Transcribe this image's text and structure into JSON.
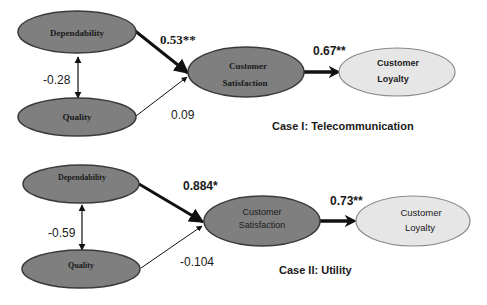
{
  "colors": {
    "node_dark": "#7f7f7f",
    "node_dark_stroke": "#3a3a3a",
    "node_light": "#e6e6e6",
    "node_light_stroke": "#8a8a8a",
    "arrow": "#111111",
    "text": "#1a1a1a"
  },
  "case1": {
    "title": "Case I: Telecommunication",
    "nodes": {
      "dependability": "Dependability",
      "quality": "Quality",
      "satisfaction_l1": "Customer",
      "satisfaction_l2": "Satisfaction",
      "loyalty_l1": "Customer",
      "loyalty_l2": "Loyalty"
    },
    "paths": {
      "dep_to_sat": "0.53**",
      "qual_to_sat": "0.09",
      "dep_qual_corr": "-0.28",
      "sat_to_loy": "0.67**"
    }
  },
  "case2": {
    "title": "Case II: Utility",
    "nodes": {
      "dependability": "Dependability",
      "quality": "Quality",
      "satisfaction_l1": "Customer",
      "satisfaction_l2": "Satisfaction",
      "loyalty_l1": "Customer",
      "loyalty_l2": "Loyalty"
    },
    "paths": {
      "dep_to_sat": "0.884*",
      "qual_to_sat": "-0.104",
      "dep_qual_corr": "-0.59",
      "sat_to_loy": "0.73**"
    }
  }
}
